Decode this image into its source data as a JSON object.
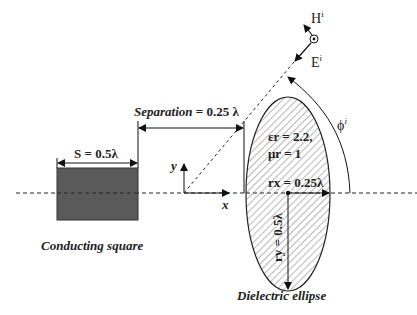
{
  "diagram": {
    "square": {
      "size_label": "S = 0.5λ",
      "caption": "Conducting square",
      "fill": "#5a5a5a"
    },
    "separation": {
      "label_italic": "Separation",
      "label_value": " = 0.25 λ"
    },
    "axes": {
      "x_label": "x",
      "y_label": "y"
    },
    "ellipse": {
      "eps_label": "εr = 2.2,",
      "mu_label": "μr = 1",
      "rx_label": "rx = 0.25λ",
      "ry_label": "ry = 0.5λ",
      "caption": "Dielectric ellipse",
      "hatch_color": "#9a9a9a"
    },
    "incident": {
      "h_label": "H",
      "h_sup": "i",
      "e_label": "E",
      "e_sup": "i",
      "angle_label": "ϕ",
      "angle_sup": "i"
    }
  }
}
